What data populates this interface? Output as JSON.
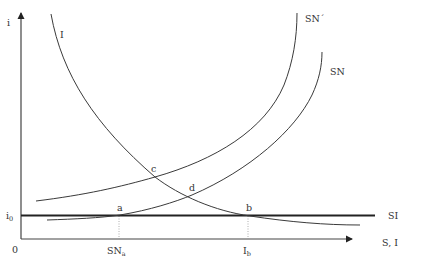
{
  "header": {
    "faint_text": "· · · · · · · · · · · · · · · · · · · · · ·"
  },
  "axes": {
    "y_label": "i",
    "x_label": "S, I",
    "origin_label": "0",
    "y_tick": {
      "main": "i",
      "sub": "0"
    },
    "x_ticks": [
      {
        "main": "SN",
        "sub": "a"
      },
      {
        "main": "I",
        "sub": "b"
      }
    ]
  },
  "curves": {
    "investment": {
      "label": "I"
    },
    "savings_shifted": {
      "label": "SN´"
    },
    "savings": {
      "label": "SN"
    },
    "si_line": {
      "label": "SI"
    }
  },
  "points": {
    "a": "a",
    "b": "b",
    "c": "c",
    "d": "d"
  },
  "colors": {
    "line": "#3a3a3a",
    "thick_line": "#222222",
    "guide": "#888888",
    "text": "#333333"
  }
}
